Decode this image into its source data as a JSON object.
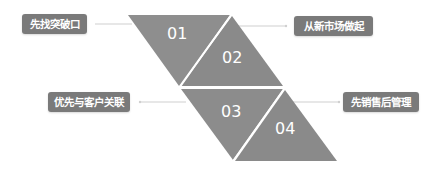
{
  "diagram": {
    "type": "four-step triangle diagram",
    "colors": {
      "triangle_fill": "#8c8c8c",
      "label_background": "#7a7a7a",
      "label_text": "#ffffff",
      "connector_line": "#cfcfcf",
      "separator": "#ffffff"
    },
    "steps": [
      {
        "number": "01",
        "label": "先找突破口"
      },
      {
        "number": "02",
        "label": "从新市场做起"
      },
      {
        "number": "03",
        "label": "优先与客户关联"
      },
      {
        "number": "04",
        "label": "先销售后管理"
      }
    ]
  }
}
